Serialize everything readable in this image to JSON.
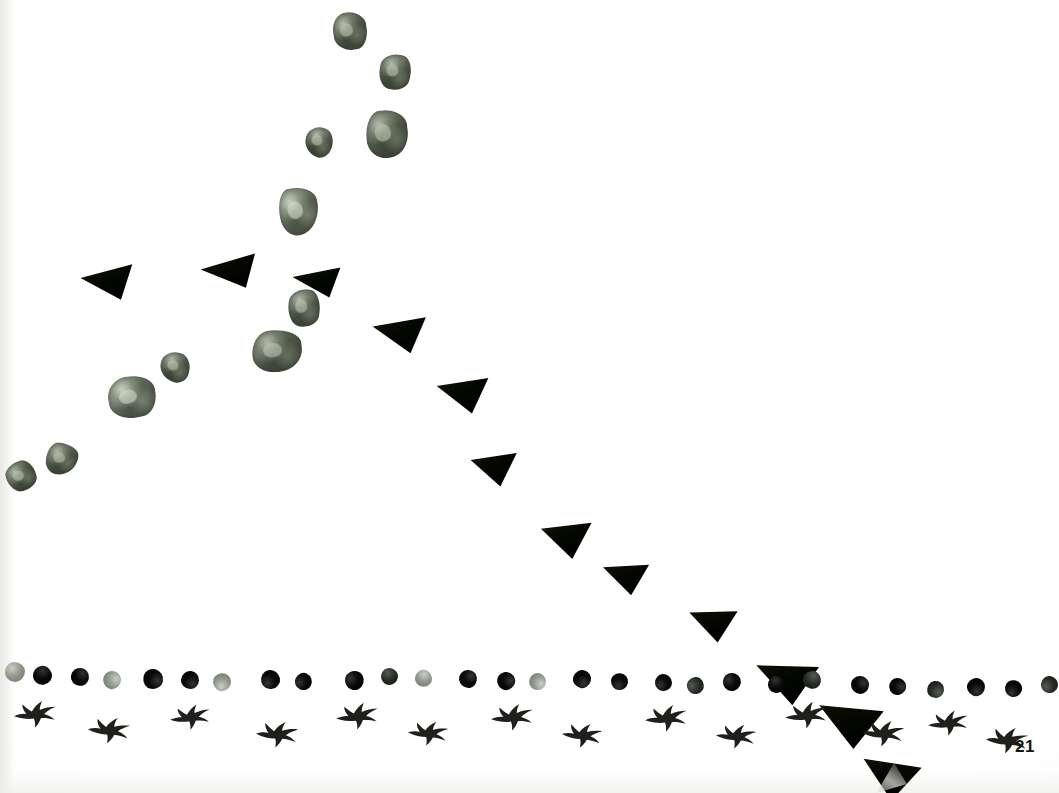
{
  "page": {
    "number": "21",
    "width": 1059,
    "height": 793,
    "background_color": "#fefefe",
    "medium": "scanned book page"
  },
  "palette": {
    "paper": "#fefefe",
    "stone": "#66705d",
    "stone_highlight": "#b0b8a4",
    "triangle": "#1b1e18",
    "dot_dark": "#0f0f0f",
    "dot_mid": "#2e322c",
    "dot_light": "#8e948a",
    "bird": "#1d201b",
    "page_number": "#15150f"
  },
  "chart_data": {
    "type": "scatter",
    "xlabel": "",
    "ylabel": "",
    "xlim": [
      0,
      1059
    ],
    "ylim": [
      0,
      793
    ],
    "grid": false,
    "legend": null,
    "note": "Coordinates are pixel positions of each physical object placed on the white page.",
    "series": [
      {
        "name": "stones",
        "marker": "stone",
        "color": "#66705d",
        "points": [
          {
            "x": 333,
            "y": 12,
            "w": 34,
            "h": 38,
            "rot": -8,
            "shape": "s1",
            "tone": "mid"
          },
          {
            "x": 379,
            "y": 54,
            "w": 32,
            "h": 36,
            "rot": 14,
            "shape": "s2",
            "tone": "mid"
          },
          {
            "x": 366,
            "y": 110,
            "w": 42,
            "h": 48,
            "rot": -6,
            "shape": "s3",
            "tone": "mid"
          },
          {
            "x": 305,
            "y": 127,
            "w": 28,
            "h": 30,
            "rot": 20,
            "shape": "s4",
            "tone": "mid"
          },
          {
            "x": 279,
            "y": 187,
            "w": 40,
            "h": 48,
            "rot": -12,
            "shape": "s5",
            "tone": "light"
          },
          {
            "x": 288,
            "y": 289,
            "w": 32,
            "h": 38,
            "rot": 6,
            "shape": "s2",
            "tone": "mid"
          },
          {
            "x": 252,
            "y": 330,
            "w": 50,
            "h": 42,
            "rot": -4,
            "shape": "s3",
            "tone": "mid"
          },
          {
            "x": 160,
            "y": 352,
            "w": 30,
            "h": 30,
            "rot": 16,
            "shape": "s4",
            "tone": "mid"
          },
          {
            "x": 108,
            "y": 376,
            "w": 48,
            "h": 42,
            "rot": -10,
            "shape": "s1",
            "tone": "light"
          },
          {
            "x": 46,
            "y": 443,
            "w": 32,
            "h": 32,
            "rot": 8,
            "shape": "s5",
            "tone": "mid"
          },
          {
            "x": 6,
            "y": 461,
            "w": 30,
            "h": 30,
            "rot": -18,
            "shape": "s2",
            "tone": "mid"
          }
        ]
      },
      {
        "name": "triangles",
        "marker": "triangle-left",
        "color": "#1b1e18",
        "points": [
          {
            "x": 76,
            "y": 256,
            "w": 52,
            "h": 40,
            "rot": 8
          },
          {
            "x": 196,
            "y": 247,
            "w": 56,
            "h": 38,
            "rot": 4
          },
          {
            "x": 288,
            "y": 259,
            "w": 48,
            "h": 34,
            "rot": 10
          },
          {
            "x": 368,
            "y": 306,
            "w": 52,
            "h": 42,
            "rot": 14
          },
          {
            "x": 432,
            "y": 366,
            "w": 50,
            "h": 42,
            "rot": 16
          },
          {
            "x": 466,
            "y": 441,
            "w": 44,
            "h": 40,
            "rot": 18
          },
          {
            "x": 536,
            "y": 509,
            "w": 48,
            "h": 44,
            "rot": 20
          },
          {
            "x": 598,
            "y": 551,
            "w": 44,
            "h": 38,
            "rot": 22
          },
          {
            "x": 684,
            "y": 596,
            "w": 46,
            "h": 40,
            "rot": 24
          },
          {
            "x": 750,
            "y": 647,
            "w": 60,
            "h": 50,
            "rot": 26
          },
          {
            "x": 812,
            "y": 688,
            "w": 62,
            "h": 52,
            "rot": 30
          },
          {
            "x": 856,
            "y": 744,
            "w": 56,
            "h": 48,
            "rot": 34
          }
        ]
      },
      {
        "name": "dots",
        "marker": "dot",
        "baseline_y": 668,
        "count": 27,
        "points": [
          {
            "x": 5,
            "y": 662,
            "d": 20,
            "tone": "light"
          },
          {
            "x": 33,
            "y": 666,
            "d": 19,
            "tone": "dark"
          },
          {
            "x": 71,
            "y": 668,
            "d": 18,
            "tone": "dark"
          },
          {
            "x": 103,
            "y": 671,
            "d": 18,
            "tone": "light"
          },
          {
            "x": 143,
            "y": 669,
            "d": 20,
            "tone": "dark"
          },
          {
            "x": 181,
            "y": 671,
            "d": 18,
            "tone": "dark"
          },
          {
            "x": 213,
            "y": 673,
            "d": 18,
            "tone": "light"
          },
          {
            "x": 261,
            "y": 670,
            "d": 19,
            "tone": "dark"
          },
          {
            "x": 295,
            "y": 673,
            "d": 17,
            "tone": "dark"
          },
          {
            "x": 345,
            "y": 671,
            "d": 19,
            "tone": "dark"
          },
          {
            "x": 381,
            "y": 668,
            "d": 17,
            "tone": "mid"
          },
          {
            "x": 415,
            "y": 670,
            "d": 17,
            "tone": "light"
          },
          {
            "x": 459,
            "y": 670,
            "d": 18,
            "tone": "dark"
          },
          {
            "x": 497,
            "y": 672,
            "d": 18,
            "tone": "dark"
          },
          {
            "x": 529,
            "y": 673,
            "d": 17,
            "tone": "light"
          },
          {
            "x": 573,
            "y": 670,
            "d": 18,
            "tone": "dark"
          },
          {
            "x": 611,
            "y": 673,
            "d": 17,
            "tone": "dark"
          },
          {
            "x": 655,
            "y": 674,
            "d": 17,
            "tone": "dark"
          },
          {
            "x": 687,
            "y": 677,
            "d": 17,
            "tone": "mid"
          },
          {
            "x": 723,
            "y": 673,
            "d": 18,
            "tone": "dark"
          },
          {
            "x": 768,
            "y": 676,
            "d": 17,
            "tone": "dark"
          },
          {
            "x": 803,
            "y": 671,
            "d": 18,
            "tone": "mid"
          },
          {
            "x": 851,
            "y": 676,
            "d": 18,
            "tone": "dark"
          },
          {
            "x": 889,
            "y": 678,
            "d": 17,
            "tone": "dark"
          },
          {
            "x": 927,
            "y": 681,
            "d": 17,
            "tone": "mid"
          },
          {
            "x": 967,
            "y": 678,
            "d": 18,
            "tone": "dark"
          },
          {
            "x": 1005,
            "y": 680,
            "d": 17,
            "tone": "dark"
          },
          {
            "x": 1041,
            "y": 676,
            "d": 17,
            "tone": "mid"
          }
        ]
      },
      {
        "name": "birds",
        "marker": "bird",
        "color": "#1d201b",
        "count": 16,
        "points": [
          {
            "x": 12,
            "y": 696,
            "w": 46,
            "h": 34,
            "rot": -4
          },
          {
            "x": 86,
            "y": 712,
            "w": 46,
            "h": 34,
            "rot": 4
          },
          {
            "x": 168,
            "y": 700,
            "w": 44,
            "h": 32,
            "rot": -6
          },
          {
            "x": 254,
            "y": 716,
            "w": 46,
            "h": 34,
            "rot": 3
          },
          {
            "x": 334,
            "y": 698,
            "w": 46,
            "h": 34,
            "rot": -5
          },
          {
            "x": 406,
            "y": 716,
            "w": 44,
            "h": 32,
            "rot": 4
          },
          {
            "x": 489,
            "y": 699,
            "w": 46,
            "h": 34,
            "rot": -4
          },
          {
            "x": 560,
            "y": 718,
            "w": 44,
            "h": 32,
            "rot": 5
          },
          {
            "x": 643,
            "y": 700,
            "w": 46,
            "h": 34,
            "rot": -4
          },
          {
            "x": 714,
            "y": 719,
            "w": 44,
            "h": 32,
            "rot": 4
          },
          {
            "x": 783,
            "y": 697,
            "w": 46,
            "h": 34,
            "rot": -5
          },
          {
            "x": 860,
            "y": 715,
            "w": 46,
            "h": 34,
            "rot": 3
          },
          {
            "x": 926,
            "y": 706,
            "w": 44,
            "h": 32,
            "rot": -5
          },
          {
            "x": 984,
            "y": 722,
            "w": 46,
            "h": 34,
            "rot": 4
          }
        ]
      }
    ]
  }
}
